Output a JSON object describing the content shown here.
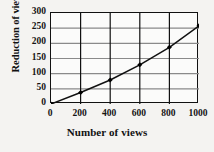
{
  "chart_data": {
    "type": "line",
    "title": "",
    "xlabel": "Number of views",
    "ylabel": "Reduction of views",
    "x": [
      0,
      200,
      400,
      600,
      800,
      1000
    ],
    "values": [
      0,
      38,
      79,
      129,
      187,
      258
    ],
    "series": [
      {
        "name": "Reduction of views",
        "x": [
          0,
          200,
          400,
          600,
          800,
          1000
        ],
        "values": [
          0,
          38,
          79,
          129,
          187,
          258
        ]
      }
    ],
    "xlim": [
      0,
      1000
    ],
    "ylim": [
      0,
      300
    ],
    "xticks": [
      0,
      200,
      400,
      600,
      800,
      1000
    ],
    "yticks": [
      0,
      50,
      100,
      150,
      200,
      250,
      300
    ],
    "xtick_labels": [
      "0",
      "200",
      "400",
      "600",
      "800",
      "1000"
    ],
    "ytick_labels": [
      "0",
      "50",
      "100",
      "150",
      "200",
      "250",
      "300"
    ],
    "grid": true,
    "legend": false,
    "marker": "filled-diamond",
    "line_color": "#111111",
    "marker_color": "#000000",
    "grid_color": "#8a8a8a",
    "axis_color": "#111111",
    "background_color": "#f4f3f1",
    "plot_background_color": "#fbfbfa"
  }
}
